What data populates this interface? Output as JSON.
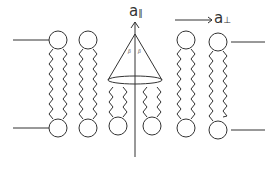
{
  "diagram": {
    "title": "",
    "labels": {
      "parallel_axis": {
        "base": "a",
        "subscript": "∥"
      },
      "perpendicular_axis": {
        "base": "a",
        "subscript": "⊥"
      },
      "cone_angle_left": "β",
      "cone_angle_right": "β"
    },
    "colors": {
      "stroke": "#333333",
      "background": "#ffffff"
    },
    "lipids": {
      "top_leaflet_x": [
        58,
        88,
        186,
        218
      ],
      "bottom_leaflet_x": [
        58,
        88,
        118,
        152,
        186,
        218
      ],
      "head_radius": 9,
      "top_head_y": 40,
      "bottom_head_y": 128
    },
    "cone": {
      "apex": [
        135,
        34
      ],
      "base_center": [
        135,
        80
      ],
      "base_rx": 27,
      "base_ry": 4
    },
    "membrane_boundary_lines": [
      {
        "x1": 13,
        "y1": 40,
        "x2": 49,
        "y2": 40
      },
      {
        "x1": 13,
        "y1": 128,
        "x2": 49,
        "y2": 128
      },
      {
        "x1": 231,
        "y1": 42,
        "x2": 265,
        "y2": 42
      },
      {
        "x1": 231,
        "y1": 130,
        "x2": 265,
        "y2": 130
      }
    ]
  }
}
